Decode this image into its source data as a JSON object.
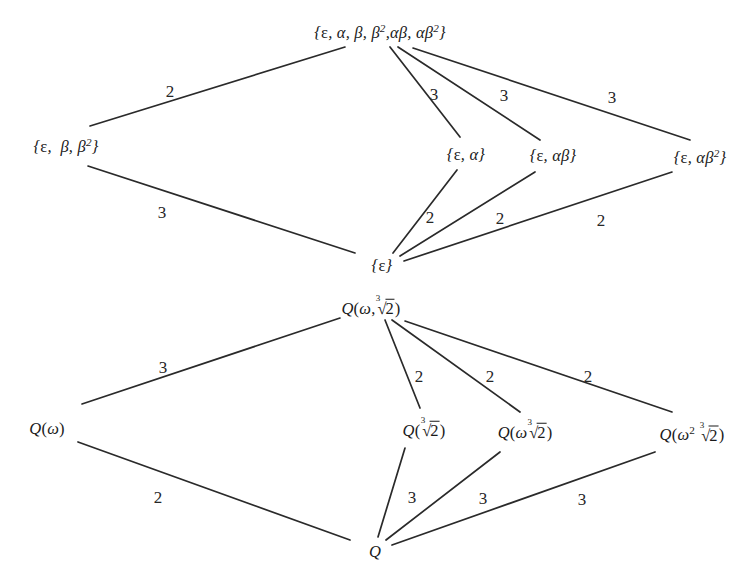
{
  "figure": {
    "kind": "two-lattice-diagram",
    "background_color": "#ffffff",
    "line_color": "#2a2a2a",
    "text_color": "#1a1a1a"
  },
  "group_lattice": {
    "name": "subgroup-lattice",
    "nodes": {
      "top": "{ε, α, β, β²,αβ, αβ²}",
      "left": "{ε, β, β²}",
      "mid1": "{ε, α}",
      "mid2": "{ε, αβ}",
      "mid3": "{ε, αβ²}",
      "bottom": "{ε}"
    },
    "edge_labels": {
      "top_left": "2",
      "top_mid1": "3",
      "top_mid2": "3",
      "top_mid3": "3",
      "left_bottom": "3",
      "mid1_bottom": "2",
      "mid2_bottom": "2",
      "mid3_bottom": "2"
    }
  },
  "field_lattice": {
    "name": "field-extension-lattice",
    "nodes": {
      "top": "Q(ω,∛2)",
      "left": "Q(ω)",
      "mid1": "Q(∛2)",
      "mid2": "Q(ω∛2)",
      "mid3": "Q(ω²∛2)",
      "bottom": "Q"
    },
    "edge_labels": {
      "top_left": "3",
      "top_mid1": "2",
      "top_mid2": "2",
      "top_mid3": "2",
      "left_bottom": "2",
      "mid1_bottom": "3",
      "mid2_bottom": "3",
      "mid3_bottom": "3"
    }
  }
}
